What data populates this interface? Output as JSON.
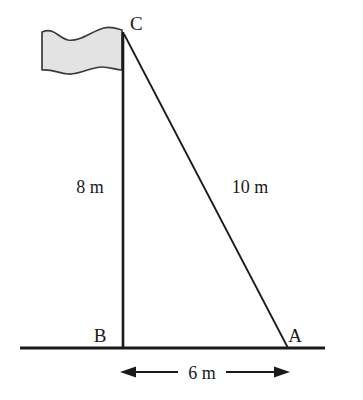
{
  "figure": {
    "type": "geometry-diagram",
    "background_color": "#ffffff",
    "stroke_color": "#1a1a1a",
    "flag_fill_color": "#e3e3e3",
    "flag_outline_color": "#3a3a3a"
  },
  "vertices": [
    {
      "id": "C",
      "label": "C",
      "role": "top-of-flagpole",
      "x": 123,
      "y": 33,
      "label_x": 130,
      "label_y": 30
    },
    {
      "id": "B",
      "label": "B",
      "role": "base-of-flagpole",
      "x": 123,
      "y": 348,
      "label_x": 100,
      "label_y": 342
    },
    {
      "id": "A",
      "label": "A",
      "role": "ground-anchor-point",
      "x": 288,
      "y": 348,
      "label_x": 295,
      "label_y": 342
    }
  ],
  "measurements": [
    {
      "id": "BC",
      "label": "8 m",
      "value": 8,
      "unit": "m",
      "side": "vertical-pole-height",
      "label_x": 90,
      "label_y": 193
    },
    {
      "id": "CA",
      "label": "10 m",
      "value": 10,
      "unit": "m",
      "side": "hypotenuse-guy-line",
      "label_x": 250,
      "label_y": 193
    },
    {
      "id": "BA",
      "label": "6 m",
      "value": 6,
      "unit": "m",
      "side": "ground-base",
      "label_x": 202,
      "label_y": 379
    }
  ],
  "ground_line": {
    "name": "ground",
    "x1": 20,
    "y1": 348,
    "x2": 325,
    "y2": 348,
    "stroke_width": 3
  },
  "flagpole": {
    "name": "flagpole",
    "x1": 123,
    "y1": 32,
    "x2": 123,
    "y2": 348,
    "stroke_width": 2.6
  },
  "guy_line": {
    "name": "guy-line",
    "x1": 124,
    "y1": 34,
    "x2": 288,
    "y2": 348,
    "stroke_width": 1.8
  },
  "dimension_line": {
    "name": "base-dimension",
    "y": 372,
    "x_start": 120,
    "x_end": 290,
    "arrow_left": true,
    "arrow_right": true,
    "gap_start": 178,
    "gap_end": 226
  },
  "flag": {
    "name": "flag-banner",
    "path": "M 42 32 C 55 27 58 38 68 40 C 80 42 92 31 104 28 C 112 26 118 29 122 30 L 122 70 C 116 70 110 67 102 67 C 90 67 80 75 68 74 C 58 73 52 69 42 70 Z",
    "bounds": {
      "x": 42,
      "y": 26,
      "width": 80,
      "height": 48
    }
  }
}
